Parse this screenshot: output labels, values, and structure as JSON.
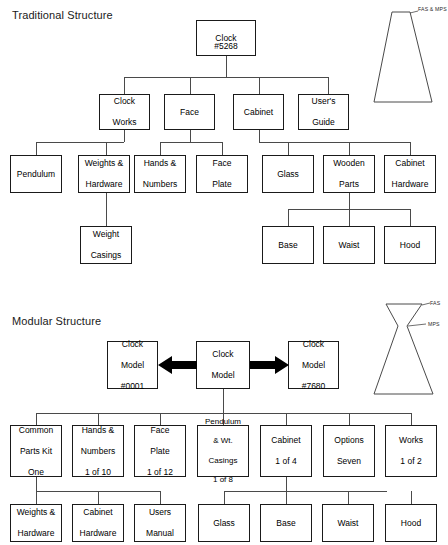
{
  "page": {
    "background": "#ffffff",
    "line_color": "#4a4a4a",
    "box_border_color": "#1a1a1a"
  },
  "sections": [
    {
      "id": "traditional",
      "title": "Traditional Structure",
      "shape": {
        "name": "a-shape-triangle",
        "description": "Narrow top widening to broad base",
        "labels": [
          "FAS & MPS"
        ]
      }
    },
    {
      "id": "modular",
      "title": "Modular Structure",
      "shape": {
        "name": "hourglass-bowtie-shape",
        "description": "Wide top narrowing at waist then widening to broad base",
        "labels": [
          "FAS",
          "MPS"
        ]
      }
    }
  ],
  "traditional": {
    "root": {
      "label": "Clock\n#5268",
      "lines": [
        "Clock",
        "#5268"
      ]
    },
    "level2": [
      {
        "label": "Clock Works",
        "lines": [
          "Clock",
          "Works"
        ]
      },
      {
        "label": "Face",
        "lines": [
          "Face"
        ]
      },
      {
        "label": "Cabinet",
        "lines": [
          "Cabinet"
        ]
      },
      {
        "label": "User's Guide",
        "lines": [
          "User's",
          "Guide"
        ]
      }
    ],
    "level3": [
      {
        "label": "Pendulum",
        "lines": [
          "Pendulum"
        ],
        "parent": "Clock Works"
      },
      {
        "label": "Weights & Hardware",
        "lines": [
          "Weights &",
          "Hardware"
        ],
        "parent": "Clock Works"
      },
      {
        "label": "Hands & Numbers",
        "lines": [
          "Hands &",
          "Numbers"
        ],
        "parent": "Face"
      },
      {
        "label": "Face Plate",
        "lines": [
          "Face",
          "Plate"
        ],
        "parent": "Face"
      },
      {
        "label": "Glass",
        "lines": [
          "Glass"
        ],
        "parent": "Cabinet"
      },
      {
        "label": "Wooden Parts",
        "lines": [
          "Wooden",
          "Parts"
        ],
        "parent": "Cabinet"
      },
      {
        "label": "Cabinet Hardware",
        "lines": [
          "Cabinet",
          "Hardware"
        ],
        "parent": "Cabinet"
      }
    ],
    "level4": [
      {
        "label": "Weight Casings",
        "lines": [
          "Weight",
          "Casings"
        ],
        "parent": "Weights & Hardware"
      },
      {
        "label": "Base",
        "lines": [
          "Base"
        ],
        "parent": "Wooden Parts"
      },
      {
        "label": "Waist",
        "lines": [
          "Waist"
        ],
        "parent": "Wooden Parts"
      },
      {
        "label": "Hood",
        "lines": [
          "Hood"
        ],
        "parent": "Wooden Parts"
      }
    ]
  },
  "modular": {
    "center": {
      "label": "Clock Model",
      "lines": [
        "Clock",
        "Model"
      ]
    },
    "left_variant": {
      "label": "Clock Model #0001",
      "lines": [
        "Clock",
        "Model",
        "#0001"
      ]
    },
    "right_variant": {
      "label": "Clock Model #7680",
      "lines": [
        "Clock",
        "Model",
        "#7680"
      ]
    },
    "arrows": [
      {
        "name": "arrow-left",
        "direction": "left"
      },
      {
        "name": "arrow-right",
        "direction": "right"
      }
    ],
    "level2": [
      {
        "label": "Common Parts Kit One",
        "lines": [
          "Common",
          "Parts Kit",
          "One"
        ]
      },
      {
        "label": "Hands & Numbers 1 of 10",
        "lines": [
          "Hands &",
          "Numbers",
          "1 of 10"
        ]
      },
      {
        "label": "Face Plate 1 of 12",
        "lines": [
          "Face",
          "Plate",
          "1 of 12"
        ]
      },
      {
        "label": "Pendulum & Wt. Casings 1 of 8",
        "lines": [
          "Pendulum",
          "& Wt.",
          "Casings",
          "1 of 8"
        ]
      },
      {
        "label": "Cabinet 1 of 4",
        "lines": [
          "Cabinet",
          "1 of 4"
        ]
      },
      {
        "label": "Options Seven",
        "lines": [
          "Options",
          "Seven"
        ]
      },
      {
        "label": "Works 1 of 2",
        "lines": [
          "Works",
          "1 of 2"
        ]
      }
    ],
    "level3": [
      {
        "label": "Weights & Hardware",
        "lines": [
          "Weights &",
          "Hardware"
        ],
        "parent": "Common Parts Kit One"
      },
      {
        "label": "Cabinet Hardware",
        "lines": [
          "Cabinet",
          "Hardware"
        ],
        "parent": "Common Parts Kit One"
      },
      {
        "label": "Users Manual",
        "lines": [
          "Users",
          "Manual"
        ],
        "parent": "Common Parts Kit One"
      },
      {
        "label": "Glass",
        "lines": [
          "Glass"
        ],
        "parent": "Cabinet 1 of 4"
      },
      {
        "label": "Base",
        "lines": [
          "Base"
        ],
        "parent": "Cabinet 1 of 4"
      },
      {
        "label": "Waist",
        "lines": [
          "Waist"
        ],
        "parent": "Cabinet 1 of 4"
      },
      {
        "label": "Hood",
        "lines": [
          "Hood"
        ],
        "parent": "Cabinet 1 of 4"
      }
    ]
  }
}
